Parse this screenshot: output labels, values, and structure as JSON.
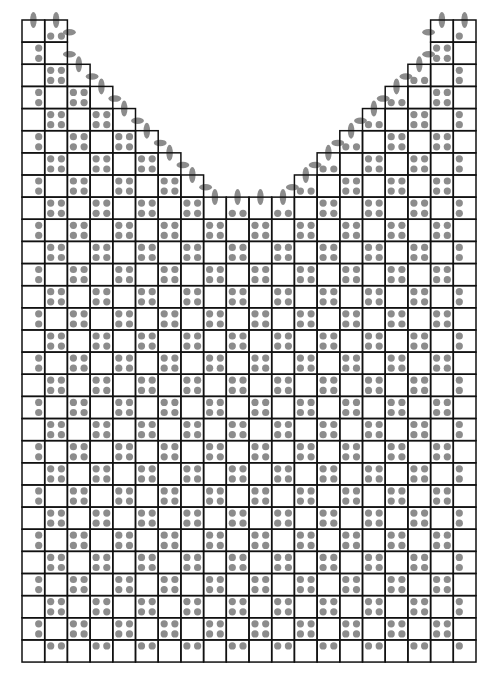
{
  "diagram": {
    "type": "knitting-chart",
    "grid": {
      "origin_x": 22,
      "origin_y": 20,
      "cell_width": 22.7,
      "cell_height": 22.14,
      "columns": 20,
      "rows": 29,
      "column_top_rows": [
        0,
        0,
        2,
        3,
        4,
        5,
        6,
        7,
        8,
        8,
        8,
        8,
        7,
        6,
        5,
        4,
        3,
        2,
        0,
        0
      ]
    },
    "stitch_dots": {
      "pattern": "checkerboard",
      "dot_cell_parity": "odd",
      "inset": 6,
      "radius": 3.6
    },
    "edge_ovals": {
      "width": 6.5,
      "height": 16
    },
    "colors": {
      "background": "#ffffff",
      "grid_line": "#111111",
      "dot": "#8c8c8c"
    },
    "line_width": 1.5
  }
}
